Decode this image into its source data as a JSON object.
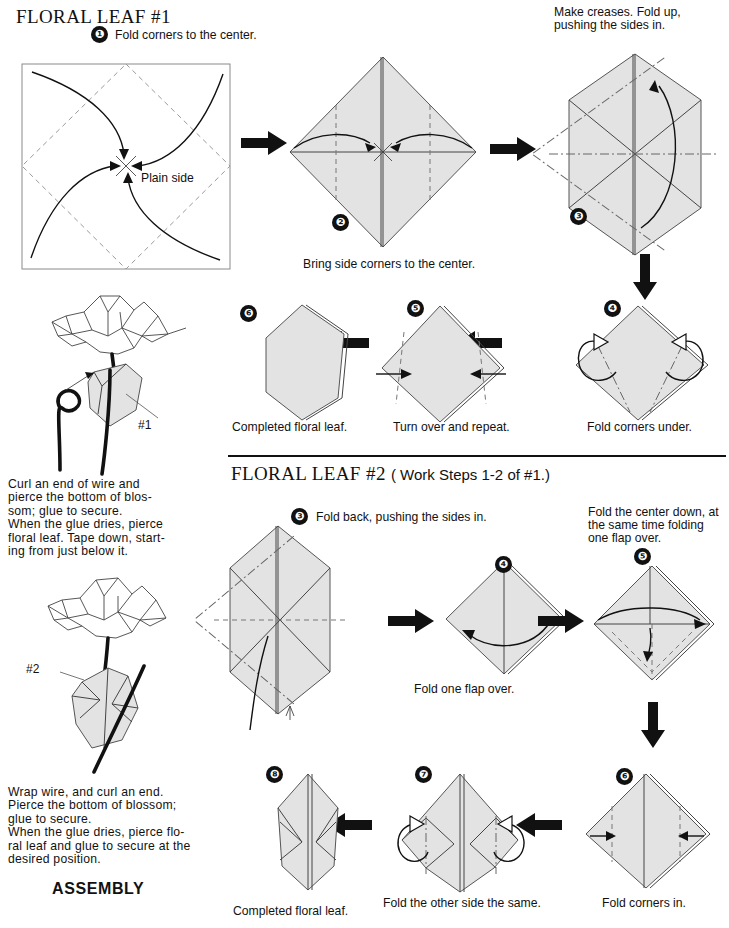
{
  "page": {
    "width": 729,
    "height": 928,
    "background": "#ffffff",
    "paper_fill": "#e3e3e3",
    "ink": "#111111"
  },
  "sections": {
    "leaf1": {
      "title": "FLORAL LEAF #1",
      "steps": [
        {
          "number": "1",
          "badge": "❶",
          "instruction": "Fold corners to the center.",
          "label": "Plain side"
        },
        {
          "number": "2",
          "badge": "❷",
          "caption": "Bring side corners to the center."
        },
        {
          "number": "3",
          "badge": "❸",
          "instruction_line1": "Make creases. Fold up,",
          "instruction_line2": "pushing the sides in."
        },
        {
          "number": "4",
          "badge": "❹",
          "caption": "Fold corners under."
        },
        {
          "number": "5",
          "badge": "❺",
          "caption": "Turn over and repeat."
        },
        {
          "number": "6",
          "badge": "❻",
          "caption": "Completed floral leaf."
        }
      ]
    },
    "leaf2": {
      "title": "FLORAL LEAF #2",
      "title_suffix": "( Work Steps 1-2 of #1.)",
      "steps": [
        {
          "number": "3",
          "badge": "❸",
          "instruction": "Fold back, pushing the sides in."
        },
        {
          "number": "4",
          "badge": "❹",
          "caption": "Fold one flap over."
        },
        {
          "number": "5",
          "badge": "❺",
          "instruction_line1": "Fold the center down, at",
          "instruction_line2": "the same time folding",
          "instruction_line3": "one flap over."
        },
        {
          "number": "6",
          "badge": "❻",
          "caption": "Fold corners in."
        },
        {
          "number": "7",
          "badge": "❼",
          "caption": "Fold the other side the same."
        },
        {
          "number": "8",
          "badge": "❽",
          "caption": "Completed floral leaf."
        }
      ]
    },
    "assembly": {
      "heading": "ASSEMBLY",
      "blossom1": {
        "tag": "#1",
        "text": "Curl an end of wire and pierce the bottom of blossom; glue to secure.\nWhen the glue dries, pierce floral leaf. Tape down, starting from just below it.",
        "lines": [
          "Curl an end of wire and",
          "pierce the bottom of blos-",
          "som; glue to secure.",
          "When the glue dries, pierce",
          "floral leaf. Tape down, start-",
          "ing from just below it."
        ]
      },
      "blossom2": {
        "tag": "#2",
        "text": "Wrap wire, and curl an end. Pierce the bottom of blossom; glue to secure.\nWhen the glue dries, pierce floral leaf and glue to secure at the desired position.",
        "lines": [
          "Wrap wire, and curl an end.",
          "Pierce the bottom of blossom;",
          "glue to secure.",
          "When the glue dries, pierce flo-",
          "ral leaf and glue to secure at the",
          "desired position."
        ]
      }
    }
  }
}
